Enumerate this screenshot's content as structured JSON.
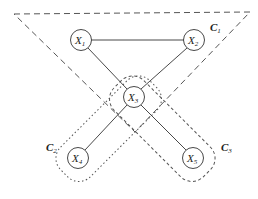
{
  "nodes": [
    {
      "id": "X1",
      "name": "X",
      "sub": "1",
      "cx": 81,
      "cy": 40
    },
    {
      "id": "X2",
      "name": "X",
      "sub": "2",
      "cx": 194,
      "cy": 40
    },
    {
      "id": "X3",
      "name": "X",
      "sub": "3",
      "cx": 134,
      "cy": 97
    },
    {
      "id": "X4",
      "name": "X",
      "sub": "4",
      "cx": 78,
      "cy": 158
    },
    {
      "id": "X5",
      "name": "X",
      "sub": "5",
      "cx": 193,
      "cy": 158
    }
  ],
  "edges": [
    [
      "X1",
      "X2"
    ],
    [
      "X1",
      "X3"
    ],
    [
      "X2",
      "X3"
    ],
    [
      "X3",
      "X4"
    ],
    [
      "X3",
      "X5"
    ]
  ],
  "clusters": [
    {
      "name": "C",
      "sub": "1"
    },
    {
      "name": "C",
      "sub": "2"
    },
    {
      "name": "C",
      "sub": "3"
    }
  ],
  "colors": {
    "stroke": "#333333",
    "cluster_stroke": "#555555"
  }
}
